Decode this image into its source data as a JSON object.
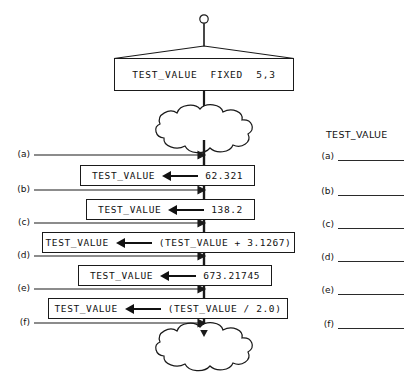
{
  "diagram": {
    "title_text": "",
    "declaration": {
      "name": "TEST_VALUE",
      "attribute": "FIXED",
      "precision": "5,3",
      "full_text": "TEST_VALUE  FIXED  5,3"
    },
    "clouds": [
      {
        "name": "upper-cloud",
        "meaning": "other processing"
      },
      {
        "name": "lower-cloud",
        "meaning": "other processing"
      }
    ],
    "statements": [
      {
        "id": "a",
        "variable": "TEST_VALUE",
        "operator": "←",
        "value": "62.321",
        "full_text": "TEST_VALUE ← 62.321"
      },
      {
        "id": "b",
        "variable": "TEST_VALUE",
        "operator": "←",
        "value": "138.2",
        "full_text": "TEST_VALUE ← 138.2"
      },
      {
        "id": "c",
        "variable": "TEST_VALUE",
        "operator": "←",
        "value": "(TEST_VALUE + 3.1267)",
        "full_text": "TEST_VALUE ← (TEST_VALUE + 3.1267)"
      },
      {
        "id": "d",
        "variable": "TEST_VALUE",
        "operator": "←",
        "value": "673.21745",
        "full_text": "TEST_VALUE ← 673.21745"
      },
      {
        "id": "e",
        "variable": "TEST_VALUE",
        "operator": "←",
        "value": "(TEST_VALUE / 2.0)",
        "full_text": "TEST_VALUE ← (TEST_VALUE / 2.0)"
      }
    ],
    "point_labels": [
      {
        "id": "a",
        "text": "(a)"
      },
      {
        "id": "b",
        "text": "(b)"
      },
      {
        "id": "c",
        "text": "(c)"
      },
      {
        "id": "d",
        "text": "(d)"
      },
      {
        "id": "e",
        "text": "(e)"
      },
      {
        "id": "f",
        "text": "(f)"
      }
    ]
  },
  "answer_sheet": {
    "header": "TEST_VALUE",
    "rows": [
      {
        "id": "a",
        "label": "(a)",
        "value": ""
      },
      {
        "id": "b",
        "label": "(b)",
        "value": ""
      },
      {
        "id": "c",
        "label": "(c)",
        "value": ""
      },
      {
        "id": "d",
        "label": "(d)",
        "value": ""
      },
      {
        "id": "e",
        "label": "(e)",
        "value": ""
      },
      {
        "id": "f",
        "label": "(f)",
        "value": ""
      }
    ]
  },
  "colors": {
    "ink": "#111111",
    "stroke": "#1a1a1a",
    "paper": "#ffffff"
  }
}
